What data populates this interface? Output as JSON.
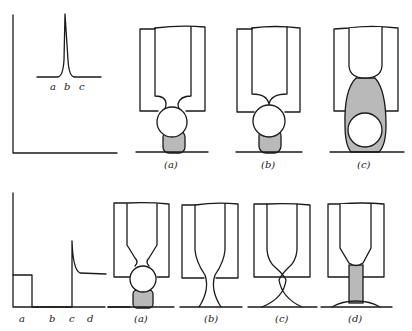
{
  "figure": {
    "top_row": {
      "graph": {
        "axis_labels": [
          "a",
          "b",
          "c"
        ]
      },
      "panels": [
        {
          "id": "a",
          "label": "(a)"
        },
        {
          "id": "b",
          "label": "(b)"
        },
        {
          "id": "c",
          "label": "(c)"
        }
      ]
    },
    "bottom_row": {
      "graph": {
        "axis_labels": [
          "a",
          "b",
          "c",
          "d"
        ]
      },
      "panels": [
        {
          "id": "a",
          "label": "(a)"
        },
        {
          "id": "b",
          "label": "(b)"
        },
        {
          "id": "c",
          "label": "(c)"
        },
        {
          "id": "d",
          "label": "(d)"
        }
      ]
    },
    "colors": {
      "line": "#1a1a1a",
      "shade": "#b9b9b9",
      "background": "#ffffff"
    }
  }
}
